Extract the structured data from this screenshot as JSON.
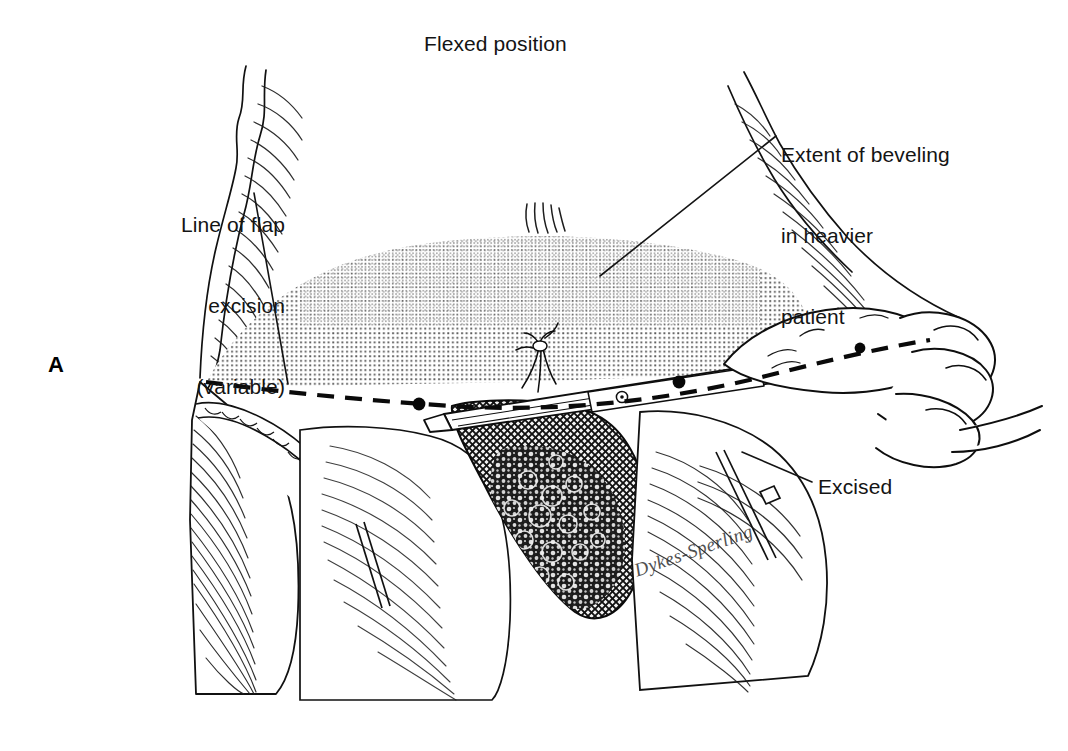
{
  "figure": {
    "panel_letter": "A",
    "title": "Flexed position",
    "signature": "Dykes-Sperling",
    "background_color": "#ffffff",
    "ink_color": "#111111",
    "stipple_color": "#6e6e6e"
  },
  "labels": {
    "title": "Flexed position",
    "beveling": {
      "line1": "Extent of beveling",
      "line2": "in heavier",
      "line3": "patient"
    },
    "flap": {
      "line1": "Line of flap",
      "line2": "excision",
      "line3": "(variable)"
    },
    "excised": "Excised"
  },
  "annotations": {
    "excision_line_style": "dashed",
    "excision_marker_dots": 3,
    "beveling_zone_fill": "stipple"
  }
}
